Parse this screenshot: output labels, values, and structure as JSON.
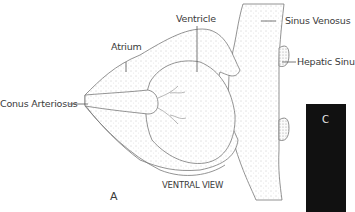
{
  "diagram": {
    "view_label": "VENTRAL VIEW",
    "panel_letter": "A",
    "labels": {
      "ventricle": "Ventricle",
      "atrium": "Atrium",
      "sinus_venosus": "Sinus Venosus",
      "hepatic_sinus": "Hepatic Sinu",
      "conus_arteriosus": "Conus Arteriosus"
    },
    "overlay_box": {
      "text": "C",
      "color": "#111111"
    }
  }
}
